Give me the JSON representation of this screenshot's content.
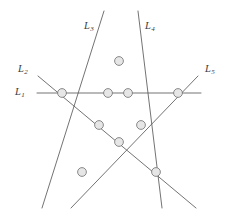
{
  "figure": {
    "canvas": {
      "width": 227,
      "height": 221
    },
    "colors": {
      "background": "#ffffff",
      "line": "#5a5a5a",
      "node_fill": "#e6e6e6",
      "node_stroke": "#6e6e6e",
      "label_text": "#3a3a3a"
    },
    "node_radius": 4.4,
    "line_width": 0.85,
    "labels": [
      {
        "id": "L1",
        "name": "L",
        "sub": "1",
        "text": "L1",
        "x": 15,
        "y": 87
      },
      {
        "id": "L2",
        "name": "L",
        "sub": "2",
        "text": "L2",
        "x": 18,
        "y": 64
      },
      {
        "id": "L3",
        "name": "L",
        "sub": "3",
        "text": "L3",
        "x": 84,
        "y": 21
      },
      {
        "id": "L4",
        "name": "L",
        "sub": "4",
        "text": "L4",
        "x": 145,
        "y": 21
      },
      {
        "id": "L5",
        "name": "L",
        "sub": "5",
        "text": "L5",
        "x": 205,
        "y": 64
      }
    ],
    "lines": [
      {
        "id": "L1",
        "label": "L1",
        "x1": 37,
        "y1": 93,
        "x2": 201,
        "y2": 93
      },
      {
        "id": "L2",
        "label": "L2",
        "x1": 38,
        "y1": 76,
        "x2": 196,
        "y2": 208
      },
      {
        "id": "L3",
        "label": "L3",
        "x1": 104,
        "y1": 11,
        "x2": 42,
        "y2": 208
      },
      {
        "id": "L4",
        "label": "L4",
        "x1": 138,
        "y1": 11,
        "x2": 162,
        "y2": 208
      },
      {
        "id": "L5",
        "label": "L5",
        "x1": 198,
        "y1": 76,
        "x2": 71,
        "y2": 208
      }
    ],
    "nodes": [
      {
        "id": "P12",
        "lines": "L1-L2",
        "x": 62,
        "y": 93
      },
      {
        "id": "P13",
        "lines": "L1-L3",
        "x": 108,
        "y": 93
      },
      {
        "id": "P14",
        "lines": "L1-L4",
        "x": 128,
        "y": 93
      },
      {
        "id": "P15",
        "lines": "L1-L5",
        "x": 178,
        "y": 93
      },
      {
        "id": "P34",
        "lines": "L3-L4",
        "x": 119,
        "y": 61
      },
      {
        "id": "P23",
        "lines": "L2-L3",
        "x": 99,
        "y": 125
      },
      {
        "id": "P45",
        "lines": "L4-L5",
        "x": 141,
        "y": 125
      },
      {
        "id": "P25",
        "lines": "L2-L5",
        "x": 119,
        "y": 142
      },
      {
        "id": "P35",
        "lines": "L3-L5",
        "x": 82,
        "y": 172
      },
      {
        "id": "P24",
        "lines": "L2-L4",
        "x": 156,
        "y": 172
      }
    ]
  }
}
